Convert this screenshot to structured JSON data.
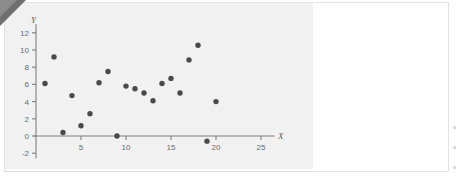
{
  "chart_data": {
    "type": "scatter",
    "title": "",
    "xlabel": "X",
    "ylabel": "Y",
    "xlim": [
      0,
      26.5
    ],
    "ylim": [
      -2.6,
      13
    ],
    "grid": false,
    "legend": null,
    "x_ticks": [
      5,
      10,
      15,
      20,
      25
    ],
    "y_ticks": [
      -2,
      0,
      2,
      4,
      6,
      8,
      10,
      12
    ],
    "x_tick_labels": [
      "5",
      "10",
      "15",
      "20",
      "25"
    ],
    "y_tick_labels": [
      "-2",
      "0",
      "2",
      "4",
      "6",
      "8",
      "10",
      "12"
    ],
    "marker": "filled-circle",
    "marker_color": "#4a4a4a",
    "points": [
      {
        "x": 1,
        "y": 6.1
      },
      {
        "x": 2,
        "y": 9.2
      },
      {
        "x": 3,
        "y": 0.4
      },
      {
        "x": 4,
        "y": 4.7
      },
      {
        "x": 5,
        "y": 1.2
      },
      {
        "x": 6,
        "y": 2.6
      },
      {
        "x": 7,
        "y": 6.2
      },
      {
        "x": 8,
        "y": 7.5
      },
      {
        "x": 9,
        "y": 0.0
      },
      {
        "x": 10,
        "y": 5.8
      },
      {
        "x": 11,
        "y": 5.5
      },
      {
        "x": 12,
        "y": 5.0
      },
      {
        "x": 13,
        "y": 4.1
      },
      {
        "x": 14,
        "y": 6.1
      },
      {
        "x": 15,
        "y": 6.7
      },
      {
        "x": 16,
        "y": 5.0
      },
      {
        "x": 17,
        "y": 8.85
      },
      {
        "x": 18,
        "y": 10.55
      },
      {
        "x": 19,
        "y": -0.6
      },
      {
        "x": 20,
        "y": 4.0
      }
    ]
  },
  "figure": {
    "background_color": "#f1f1f1",
    "page_color": "#ffffff",
    "axis_color": "#7d7d7d",
    "label_color": "#6a6a6a"
  }
}
